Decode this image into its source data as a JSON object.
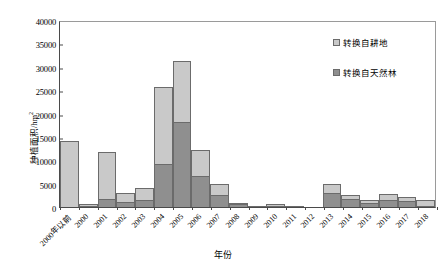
{
  "chart_data": {
    "type": "bar",
    "stacked": true,
    "title": "",
    "xlabel": "年份",
    "ylabel": "种植面积/hm²",
    "ylim": [
      0,
      40000
    ],
    "ytick_step": 5000,
    "ytick_labels": [
      "0",
      "5000",
      "10000",
      "15000",
      "20000",
      "25000",
      "30000",
      "35000",
      "40000"
    ],
    "grid": false,
    "legend_position": "top-right",
    "categories": [
      "2000年以前",
      "2000",
      "2001",
      "2002",
      "2003",
      "2004",
      "2005",
      "2006",
      "2007",
      "2008",
      "2009",
      "2010",
      "2011",
      "2012",
      "2013",
      "2014",
      "2015",
      "2016",
      "2017",
      "2018"
    ],
    "series": [
      {
        "name": "转换自天然林",
        "color": "#8f8f8f",
        "values": [
          0,
          200,
          1800,
          1000,
          1400,
          9200,
          18200,
          6600,
          2500,
          600,
          100,
          200,
          100,
          0,
          2900,
          1800,
          900,
          1400,
          1200,
          300
        ]
      },
      {
        "name": "转换自耕地",
        "color": "#c9c9c9",
        "values": [
          14200,
          400,
          9900,
          2000,
          2700,
          16500,
          13000,
          5600,
          2400,
          300,
          0,
          500,
          0,
          0,
          2100,
          800,
          600,
          1400,
          900,
          1300
        ]
      }
    ],
    "totals": [
      14200,
      600,
      11700,
      3000,
      4100,
      25700,
      31200,
      12200,
      4900,
      900,
      100,
      700,
      100,
      0,
      5000,
      2600,
      1500,
      2800,
      2100,
      1600
    ]
  },
  "legend": {
    "items": [
      {
        "label": "转换自耕地",
        "swatch": "light"
      },
      {
        "label": "转换自天然林",
        "swatch": "dark"
      }
    ]
  },
  "colors": {
    "light_gray": "#c9c9c9",
    "dark_gray": "#8f8f8f",
    "axis": "#4a4a4a",
    "background": "#ffffff"
  }
}
